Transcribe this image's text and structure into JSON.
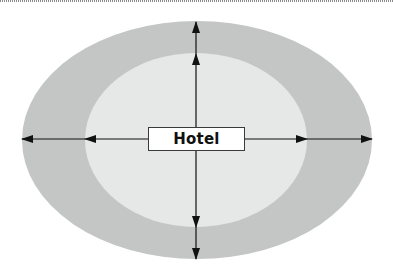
{
  "diagram": {
    "center_label": "Hotel",
    "rings": [
      {
        "name": "outer-zone",
        "color": "#c4c6c6",
        "cx": 197,
        "cy": 140,
        "rx": 175,
        "ry": 119
      },
      {
        "name": "inner-zone",
        "color": "#e6e7e7",
        "cx": 196,
        "cy": 140,
        "rx": 111,
        "ry": 87
      }
    ],
    "arrows": [
      {
        "direction": "up",
        "description": "arrow from hotel to outer ring top"
      },
      {
        "direction": "down",
        "description": "arrow from hotel to outer ring bottom"
      },
      {
        "direction": "left",
        "description": "arrow from hotel to outer ring left"
      },
      {
        "direction": "right",
        "description": "arrow from hotel to outer ring right"
      }
    ],
    "colors": {
      "outer_ring": "#c4c6c6",
      "inner_ring": "#e6e7e7",
      "arrow": "#111111",
      "box_border": "#3a3a3a",
      "background": "#ffffff"
    }
  }
}
